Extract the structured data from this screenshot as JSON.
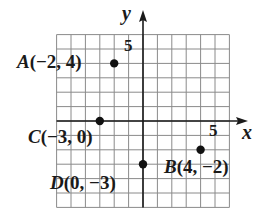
{
  "diagram": {
    "type": "coordinate-plane",
    "axes": {
      "x_label": "x",
      "y_label": "y",
      "x_tick_label": "5",
      "y_tick_label": "5",
      "x_range": [
        -6,
        6
      ],
      "y_range": [
        -6,
        6
      ]
    },
    "grid": {
      "unit": 1,
      "line_color": "#8a8a8a",
      "axis_color": "#1a1a1a"
    },
    "points": [
      {
        "name": "A",
        "coords": "(−2, 4)",
        "x": -2,
        "y": 4
      },
      {
        "name": "B",
        "coords": "(4, −2)",
        "x": 4,
        "y": -2
      },
      {
        "name": "C",
        "coords": "(−3, 0)",
        "x": -3,
        "y": 0
      },
      {
        "name": "D",
        "coords": "(0, −3)",
        "x": 0,
        "y": -3
      }
    ],
    "point_color": "#111111"
  }
}
